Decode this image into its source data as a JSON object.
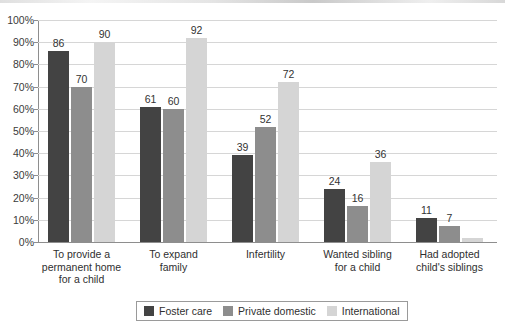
{
  "chart_data": {
    "type": "bar",
    "title": "",
    "subtitle": "",
    "xlabel": "",
    "ylabel": "",
    "ylim": [
      0,
      100
    ],
    "ytick_labels": [
      "100%",
      "90%",
      "80%",
      "70%",
      "60%",
      "50%",
      "40%",
      "30%",
      "20%",
      "10%",
      "0%"
    ],
    "ytick_values": [
      100,
      90,
      80,
      70,
      60,
      50,
      40,
      30,
      20,
      10,
      0
    ],
    "grid": true,
    "legend_position": "bottom",
    "value_labels": true,
    "categories": [
      "To provide a\npermanent home\nfor a child",
      "To expand\nfamily",
      "Infertility",
      "Wanted sibling\nfor a child",
      "Had adopted\nchild's siblings"
    ],
    "series": [
      {
        "name": "Foster care",
        "color": "#434343",
        "values": [
          86,
          61,
          39,
          24,
          11
        ]
      },
      {
        "name": "Private domestic",
        "color": "#8d8d8d",
        "values": [
          70,
          60,
          52,
          16,
          7
        ]
      },
      {
        "name": "International",
        "color": "#d5d5d5",
        "values": [
          90,
          92,
          72,
          36,
          2
        ]
      }
    ],
    "unlabeled_points": [
      {
        "category_index": 4,
        "series_index": 2,
        "note": "no value label shown"
      }
    ]
  },
  "legend": {
    "entries": [
      {
        "label": "Foster care",
        "color": "#434343"
      },
      {
        "label": "Private domestic",
        "color": "#8d8d8d"
      },
      {
        "label": "International",
        "color": "#d5d5d5"
      }
    ]
  },
  "colors": {
    "foster_care": "#434343",
    "private_domestic": "#8d8d8d",
    "international": "#d5d5d5",
    "gridline": "#d6d6d6",
    "axis": "#8e8e8e",
    "text": "#2f2f2f",
    "background": "#ffffff"
  }
}
